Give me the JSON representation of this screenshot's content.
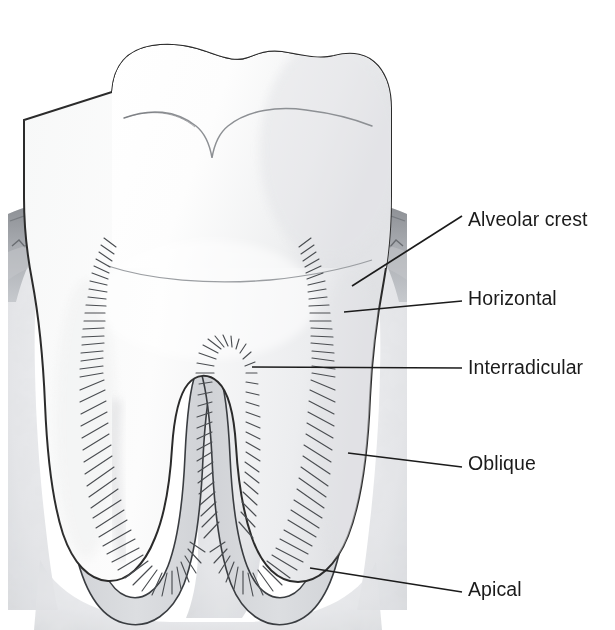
{
  "figure": {
    "kind": "anatomical-illustration",
    "style": "grayscale pencil / line drawing",
    "canvas": {
      "width": 615,
      "height": 630
    }
  },
  "palette": {
    "background": "#ffffff",
    "outline": "#2b2b2b",
    "tooth_fill_light": "#fdfdfd",
    "tooth_fill_shade": "#e9eaec",
    "bone_fill": "#e6e7e9",
    "bone_speckle": "#c9cbce",
    "gingiva_dark": "#8d9094",
    "gingiva_mid": "#b9bcc0",
    "pdl_fill": "#d6d8db",
    "fiber_stroke": "#4a4d51",
    "leader_line": "#1b1b1b",
    "label_text": "#1b1b1b"
  },
  "labels": [
    {
      "id": "alveolar-crest",
      "text": "Alveolar crest",
      "text_x": 468,
      "text_y": 221,
      "leader": {
        "x1": 462,
        "y1": 216,
        "x2": 352,
        "y2": 286
      }
    },
    {
      "id": "horizontal",
      "text": "Horizontal",
      "text_x": 468,
      "text_y": 300,
      "leader": {
        "x1": 462,
        "y1": 301,
        "x2": 344,
        "y2": 312
      }
    },
    {
      "id": "interradicular",
      "text": "Interradicular",
      "text_x": 468,
      "text_y": 369,
      "leader": {
        "x1": 462,
        "y1": 368,
        "x2": 252,
        "y2": 367
      }
    },
    {
      "id": "oblique",
      "text": "Oblique",
      "text_x": 468,
      "text_y": 465,
      "leader": {
        "x1": 462,
        "y1": 467,
        "x2": 348,
        "y2": 453
      }
    },
    {
      "id": "apical",
      "text": "Apical",
      "text_x": 468,
      "text_y": 591,
      "leader": {
        "x1": 462,
        "y1": 592,
        "x2": 310,
        "y2": 568
      }
    }
  ],
  "structures": [
    {
      "id": "crown",
      "name": "Tooth crown (enamel)"
    },
    {
      "id": "occlusal",
      "name": "Occlusal surface with cusps and central fissure"
    },
    {
      "id": "cej",
      "name": "Cementoenamel junction line"
    },
    {
      "id": "root-mesial",
      "name": "Mesial root"
    },
    {
      "id": "root-distal",
      "name": "Distal root"
    },
    {
      "id": "furcation",
      "name": "Root furcation / interradicular septum"
    },
    {
      "id": "alveolar-bone",
      "name": "Alveolar bone (speckled)"
    },
    {
      "id": "gingiva",
      "name": "Gingival tissue"
    },
    {
      "id": "pdl-space",
      "name": "Periodontal ligament space"
    },
    {
      "id": "fibers-crest",
      "name": "Alveolar crest fiber group"
    },
    {
      "id": "fibers-horiz",
      "name": "Horizontal fiber group"
    },
    {
      "id": "fibers-obliq",
      "name": "Oblique fiber group"
    },
    {
      "id": "fibers-apical",
      "name": "Apical fiber group"
    },
    {
      "id": "fibers-inter",
      "name": "Interradicular fiber group"
    }
  ]
}
